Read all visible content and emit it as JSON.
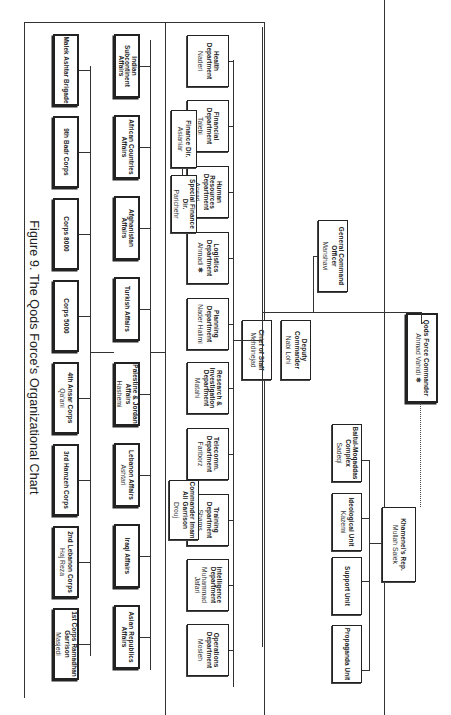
{
  "caption": "Figure 9. The Qods Force's Organizational Chart",
  "commander": {
    "title": "Qods Force Commander",
    "name": "Ahmad Vahidi ✱"
  },
  "khamenei_rep": {
    "title": "Khamenei's Rep.",
    "name": "Mullah Saiek"
  },
  "khamenei_units": [
    {
      "title": "Baitul-Moqaddas Complex",
      "name": "Sadeqi"
    },
    {
      "title": "Ideological Unit",
      "name": "Kazemi"
    },
    {
      "title": "Support Unit",
      "name": ""
    },
    {
      "title": "Propaganda Unit",
      "name": ""
    }
  ],
  "general_command": {
    "title": "General Command Officer",
    "name": "Manshavi"
  },
  "deputy": {
    "title": "Deputy Commander",
    "name": "Nabi Lohi"
  },
  "chief_of_staff": {
    "title": "Chief of Staff",
    "name": "Mehdinejad"
  },
  "departments": [
    {
      "title": "Health Department",
      "name": "Naderi"
    },
    {
      "title": "Financial Department",
      "name": "Talebi"
    },
    {
      "title": "Human Resources Department",
      "name": "Ansari"
    },
    {
      "title": "Logistics Department",
      "name": "Ahmadi ✱"
    },
    {
      "title": "Planning Department",
      "name": "Nader Halimi"
    },
    {
      "title": "Research & Investigation Department",
      "name": "Matahi"
    },
    {
      "title": "Telecomm. Department",
      "name": "Fariborz"
    },
    {
      "title": "Training Department",
      "name": "Shams"
    },
    {
      "title": "Intelligence Department",
      "name": "Muhammad Jafari"
    },
    {
      "title": "Operations Department",
      "name": "Mosleh"
    }
  ],
  "finance_subs": [
    {
      "title": "Finance Dir.",
      "name": "Asianiar"
    },
    {
      "title": "Special Finance Dir.",
      "name": "Parichehr"
    }
  ],
  "imam_ali": {
    "title": "Commander Imam Ali Garrison",
    "name": "Drouj"
  },
  "affairs": [
    {
      "title": "Indian Subcontinent Affairs",
      "name": ""
    },
    {
      "title": "African Countries Affairs",
      "name": ""
    },
    {
      "title": "Afghanistan Affairs",
      "name": ""
    },
    {
      "title": "Turkish Affairs",
      "name": ""
    },
    {
      "title": "Palestine & Jordan Affairs",
      "name": "Hashemi"
    },
    {
      "title": "Lebanon Affairs",
      "name": "Ashtari"
    },
    {
      "title": "Iraqi Affairs",
      "name": ""
    },
    {
      "title": "Asian Republics Affairs",
      "name": ""
    }
  ],
  "corps": [
    {
      "title": "Malek Ashtar Brigade",
      "name": ""
    },
    {
      "title": "9th Badr Corps",
      "name": ""
    },
    {
      "title": "Corps 8000",
      "name": ""
    },
    {
      "title": "Corps 5000",
      "name": ""
    },
    {
      "title": "4th Ansar Corps",
      "name": "Qa'ani"
    },
    {
      "title": "3rd Hamzeh Corps",
      "name": ""
    },
    {
      "title": "2nd Lebanon Corps",
      "name": "Haj Reza"
    },
    {
      "title": "1st Corps Ramadhan Garrison",
      "name": "Masjedi"
    }
  ]
}
